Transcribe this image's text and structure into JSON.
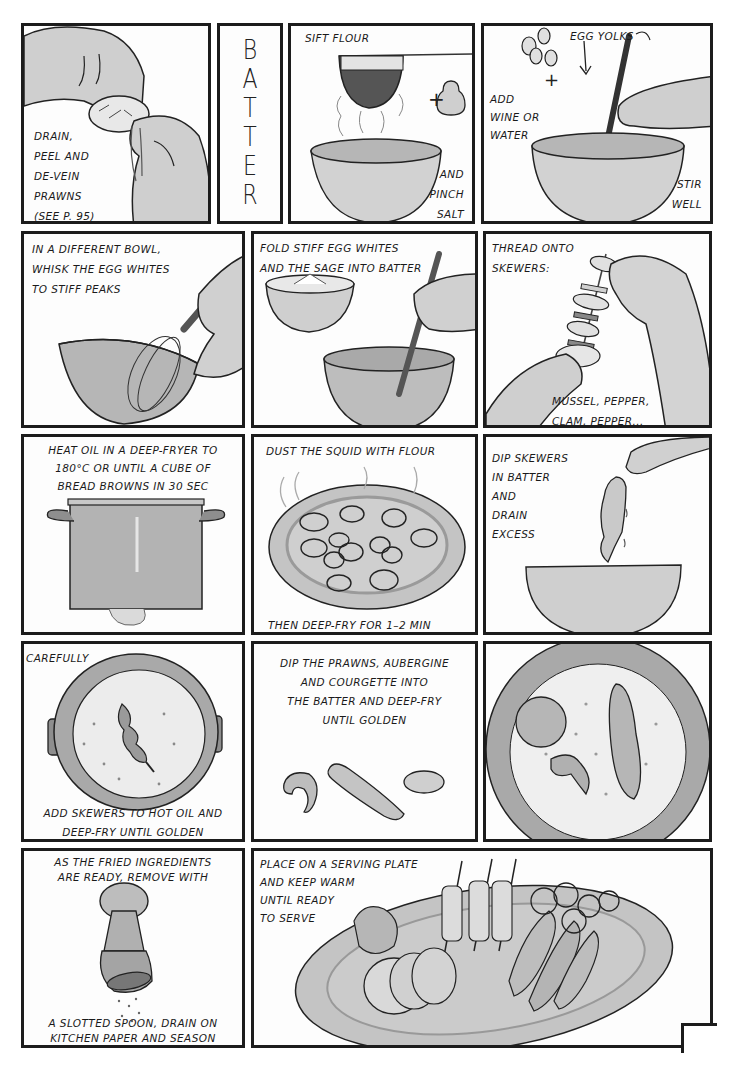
{
  "page": {
    "title_vertical": [
      "B",
      "A",
      "T",
      "T",
      "E",
      "R"
    ],
    "page_number": "67"
  },
  "colors": {
    "panel_border": "#1c1c1c",
    "light_gray": "#d6d6d6",
    "mid_gray": "#b3b3b3",
    "dark_gray": "#8e8e8e",
    "paper": "#fdfdfd"
  },
  "panels": [
    {
      "id": 1,
      "scene": "hands-peeling-prawn",
      "captions": [
        "DRAIN,\nPEEL AND\nDE-VEIN\nPRAWNS\n(SEE P. 95)"
      ]
    },
    {
      "id": 2,
      "scene": "batter-title",
      "captions": []
    },
    {
      "id": 3,
      "scene": "sieve-over-bowl-salt-shaker",
      "captions": [
        "SIFT FLOUR",
        "AND\nPINCH\nSALT"
      ],
      "symbols": [
        "+"
      ]
    },
    {
      "id": 4,
      "scene": "stirring-bowl-with-egg-yolks",
      "captions": [
        "EGG YOLKS",
        "ADD\nWINE OR\nWATER",
        "STIR\nWELL"
      ],
      "symbols": [
        "+"
      ]
    },
    {
      "id": 5,
      "scene": "whisking-egg-whites",
      "captions": [
        "IN A DIFFERENT BOWL,\nWHISK THE EGG WHITES\nTO STIFF PEAKS"
      ]
    },
    {
      "id": 6,
      "scene": "folding-egg-whites",
      "captions": [
        "FOLD STIFF EGG WHITES\nAND THE SAGE INTO BATTER"
      ]
    },
    {
      "id": 7,
      "scene": "threading-skewer",
      "captions": [
        "THREAD ONTO\nSKEWERS:",
        "MUSSEL, PEPPER,\nCLAM, PEPPER..."
      ]
    },
    {
      "id": 8,
      "scene": "deep-fryer-pot",
      "captions": [
        "HEAT OIL IN A DEEP-FRYER TO\n180°C OR UNTIL A CUBE OF\nBREAD BROWNS IN 30 SEC"
      ]
    },
    {
      "id": 9,
      "scene": "squid-rings-on-plate",
      "captions": [
        "DUST THE SQUID WITH FLOUR",
        "THEN DEEP-FRY FOR 1–2 MIN"
      ]
    },
    {
      "id": 10,
      "scene": "dipping-skewer-in-batter",
      "captions": [
        "DIP SKEWERS\nIN BATTER\nAND\nDRAIN\nEXCESS"
      ]
    },
    {
      "id": 11,
      "scene": "skewer-in-hot-oil",
      "captions": [
        "CAREFULLY",
        "ADD SKEWERS TO HOT OIL AND\nDEEP-FRY UNTIL GOLDEN"
      ]
    },
    {
      "id": 12,
      "scene": "prawn-aubergine-courgette",
      "captions": [
        "DIP THE PRAWNS, AUBERGINE\nAND COURGETTE INTO\nTHE BATTER AND DEEP-FRY\nUNTIL GOLDEN"
      ]
    },
    {
      "id": 13,
      "scene": "frying-pan-closeup",
      "captions": []
    },
    {
      "id": 14,
      "scene": "salt-shaker-seasoning",
      "captions": [
        "AS THE FRIED INGREDIENTS\nARE READY, REMOVE WITH",
        "A SLOTTED SPOON, DRAIN ON\nKITCHEN PAPER AND SEASON"
      ]
    },
    {
      "id": 15,
      "scene": "serving-platter",
      "captions": [
        "PLACE ON A SERVING PLATE\nAND KEEP WARM\nUNTIL READY\nTO SERVE"
      ]
    }
  ]
}
